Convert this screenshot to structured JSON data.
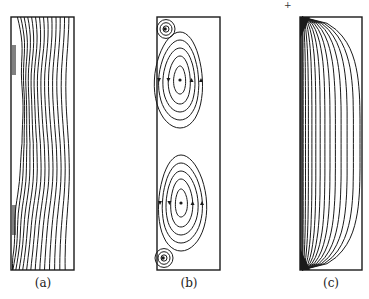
{
  "figure": {
    "panels": [
      {
        "id": "a",
        "label": "(a)",
        "description": "isotherm contours in a tall rectangular cavity, wavy lines crowded near left wall"
      },
      {
        "id": "b",
        "label": "(b)",
        "description": "streamline contours: two large counter-rotating cells with small corner eddies top-left and bottom-left, arrows on streamlines"
      },
      {
        "id": "c",
        "label": "(c)",
        "description": "contours fanning from left wall top and bottom corners, concentrated at left wall"
      }
    ],
    "stray_mark": "+",
    "line_color": "#1a1a1a"
  }
}
